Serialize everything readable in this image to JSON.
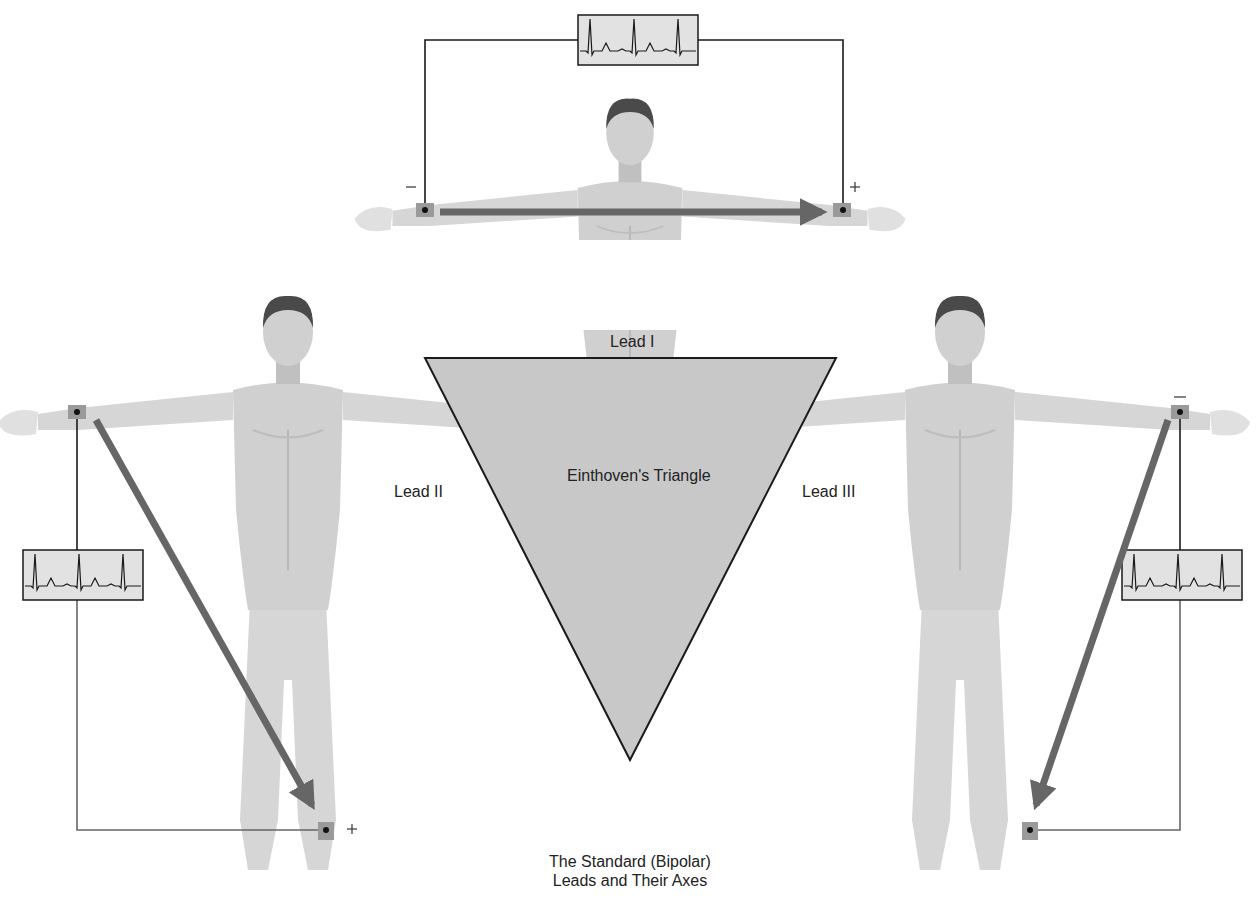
{
  "title": "Einthoven's Triangle",
  "caption": {
    "line1": "The Standard (Bipolar)",
    "line2": "Leads and Their Axes"
  },
  "leads": [
    {
      "id": "lead-1",
      "label": "Lead I",
      "negative": "Right arm",
      "positive": "Left arm"
    },
    {
      "id": "lead-2",
      "label": "Lead II",
      "negative": "Right arm",
      "positive": "Left leg"
    },
    {
      "id": "lead-3",
      "label": "Lead III",
      "negative": "Left arm",
      "positive": "Left leg"
    }
  ],
  "polarity": {
    "plus": "+",
    "minus": "−"
  },
  "colors": {
    "triangle_fill": "#c8c8c8",
    "triangle_stroke": "#1a1a1a",
    "arrow": "#666666",
    "body": "#d6d6d6",
    "body_shade": "#bdbdbd",
    "hair": "#4a4a4a",
    "ecg_bg": "#e2e2e2",
    "wire": "#1a1a1a"
  }
}
